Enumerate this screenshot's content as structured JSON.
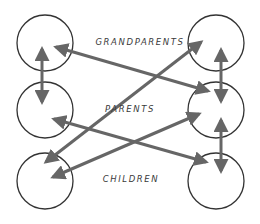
{
  "diagram": {
    "labels": {
      "grandparents": "GRANDPARENTS",
      "parents": "PARENTS",
      "children": "CHILDREN"
    },
    "colors": {
      "circle_stroke": "#333333",
      "arrow": "#666666",
      "label": "#3a3a3a",
      "background": "#ffffff"
    },
    "nodes": [
      {
        "id": "left-grandparent",
        "column": "left",
        "row": "grandparents",
        "cx": 45,
        "cy": 43,
        "r": 28
      },
      {
        "id": "left-parent",
        "column": "left",
        "row": "parents",
        "cx": 45,
        "cy": 110,
        "r": 28
      },
      {
        "id": "left-child",
        "column": "left",
        "row": "children",
        "cx": 45,
        "cy": 181,
        "r": 28
      },
      {
        "id": "right-grandparent",
        "column": "right",
        "row": "grandparents",
        "cx": 216,
        "cy": 43,
        "r": 28
      },
      {
        "id": "right-parent",
        "column": "right",
        "row": "parents",
        "cx": 216,
        "cy": 110,
        "r": 28
      },
      {
        "id": "right-child",
        "column": "right",
        "row": "children",
        "cx": 216,
        "cy": 181,
        "r": 28
      }
    ],
    "edges": [
      {
        "from": "left-grandparent",
        "to": "left-parent",
        "type": "double-arrow"
      },
      {
        "from": "right-grandparent",
        "to": "right-parent",
        "type": "double-arrow"
      },
      {
        "from": "right-parent",
        "to": "right-child",
        "type": "double-arrow"
      },
      {
        "from": "left-grandparent",
        "to": "right-parent",
        "type": "double-arrow"
      },
      {
        "from": "right-grandparent",
        "to": "left-child",
        "type": "double-arrow"
      },
      {
        "from": "left-parent",
        "to": "right-child",
        "type": "double-arrow"
      },
      {
        "from": "right-parent",
        "to": "left-child",
        "type": "double-arrow"
      }
    ]
  }
}
